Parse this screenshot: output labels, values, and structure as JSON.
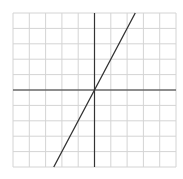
{
  "chart_data": {
    "type": "line",
    "title": "",
    "xlabel": "",
    "ylabel": "",
    "xlim": [
      -5,
      5
    ],
    "ylim": [
      -5,
      5
    ],
    "grid": true,
    "grid_step": 1,
    "series": [
      {
        "name": "y = 2x",
        "x": [
          -2.5,
          0,
          2.5
        ],
        "y": [
          -5,
          0,
          5
        ]
      }
    ]
  },
  "colors": {
    "grid": "#d4d4d4",
    "axis": "#333333",
    "line": "#333333",
    "background": "#ffffff"
  }
}
